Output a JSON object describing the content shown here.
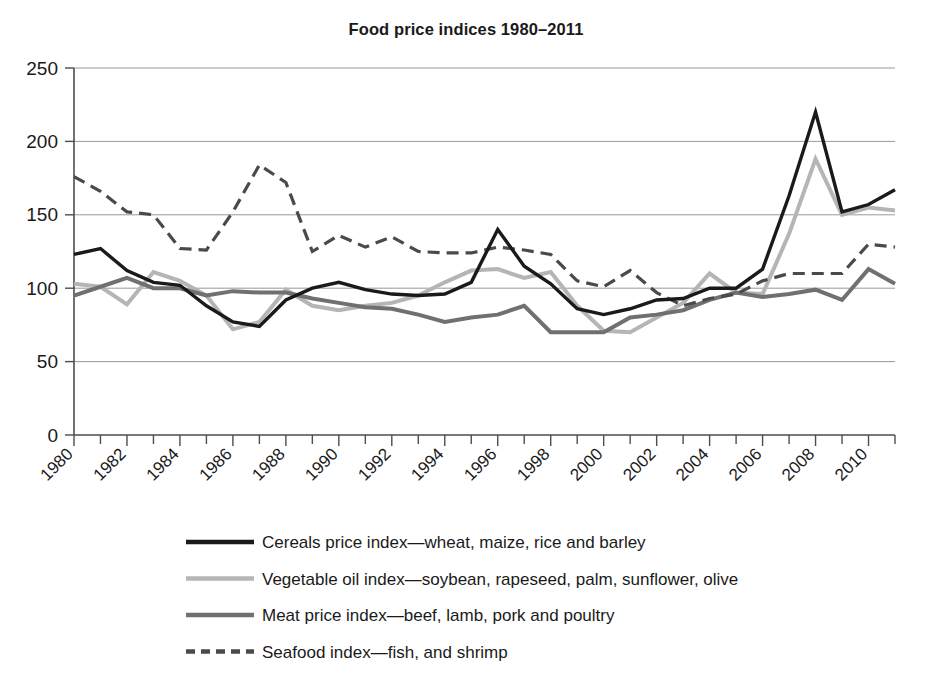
{
  "chart_data": {
    "type": "line",
    "title": "Food price indices 1980–2011",
    "xlabel": "",
    "ylabel": "",
    "ylim": [
      0,
      250
    ],
    "ytick_values": [
      0,
      50,
      100,
      150,
      200,
      250
    ],
    "ytick_labels": [
      "0",
      "50",
      "100",
      "150",
      "200",
      "250"
    ],
    "xlim": [
      1980,
      2011
    ],
    "x": [
      1980,
      1981,
      1982,
      1983,
      1984,
      1985,
      1986,
      1987,
      1988,
      1989,
      1990,
      1991,
      1992,
      1993,
      1994,
      1995,
      1996,
      1997,
      1998,
      1999,
      2000,
      2001,
      2002,
      2003,
      2004,
      2005,
      2006,
      2007,
      2008,
      2009,
      2010,
      2011
    ],
    "xtick_labels": [
      "1980",
      "1982",
      "1984",
      "1986",
      "1988",
      "1990",
      "1992",
      "1994",
      "1996",
      "1998",
      "2000",
      "2002",
      "2004",
      "2006",
      "2008",
      "2010"
    ],
    "xtick_label_step": 2,
    "xtick_minor_every": 1,
    "grid": "horizontal",
    "legend_position": "below",
    "series": [
      {
        "name": "cereals",
        "label": "Cereals price index—wheat, maize, rice and barley",
        "color": "#1a1a1a",
        "width": 3.4,
        "dash": "none",
        "values": [
          123,
          127,
          112,
          104,
          102,
          88,
          77,
          74,
          92,
          100,
          104,
          99,
          96,
          95,
          96,
          104,
          140,
          115,
          103,
          86,
          82,
          86,
          92,
          93,
          100,
          100,
          113,
          163,
          220,
          152,
          157,
          167
        ]
      },
      {
        "name": "vegetable_oil",
        "label": "Vegetable oil index—soybean, rapeseed, palm, sunflower, olive",
        "color": "#b5b5b5",
        "width": 4.0,
        "dash": "none",
        "values": [
          103,
          101,
          89,
          111,
          105,
          95,
          72,
          77,
          99,
          88,
          85,
          88,
          90,
          95,
          104,
          112,
          113,
          107,
          111,
          88,
          71,
          70,
          80,
          90,
          110,
          97,
          96,
          137,
          188,
          150,
          155,
          153
        ]
      },
      {
        "name": "meat",
        "label": "Meat price index—beef, lamb, pork and poultry",
        "color": "#707070",
        "width": 4.0,
        "dash": "none",
        "values": [
          95,
          101,
          107,
          100,
          100,
          95,
          98,
          97,
          97,
          93,
          90,
          87,
          86,
          82,
          77,
          80,
          82,
          88,
          70,
          70,
          70,
          80,
          82,
          85,
          92,
          97,
          94,
          96,
          99,
          92,
          113,
          103
        ]
      },
      {
        "name": "seafood",
        "label": "Seafood index—fish, and shrimp",
        "color": "#4a4a4a",
        "width": 3.2,
        "dash": "12,7",
        "values": [
          176,
          166,
          152,
          150,
          127,
          126,
          152,
          184,
          172,
          125,
          136,
          128,
          135,
          125,
          124,
          124,
          128,
          126,
          123,
          105,
          101,
          112,
          97,
          88,
          93,
          96,
          105,
          110,
          110,
          110,
          130,
          128
        ]
      }
    ]
  },
  "legend": {
    "items": [
      {
        "label": "Cereals price index—wheat, maize, rice and barley",
        "color": "#1a1a1a",
        "dash": "none",
        "width": 4.5
      },
      {
        "label": "Vegetable oil index—soybean, rapeseed, palm, sunflower, olive",
        "color": "#b5b5b5",
        "dash": "none",
        "width": 4.5
      },
      {
        "label": "Meat price index—beef, lamb, pork and poultry",
        "color": "#707070",
        "dash": "none",
        "width": 4.5
      },
      {
        "label": "Seafood index—fish, and shrimp",
        "color": "#4a4a4a",
        "dash": "9,6",
        "width": 4.5
      }
    ]
  },
  "colors": {
    "background": "#ffffff",
    "axis": "#4d4d4d",
    "grid": "#999999",
    "text": "#1a1a1a"
  }
}
